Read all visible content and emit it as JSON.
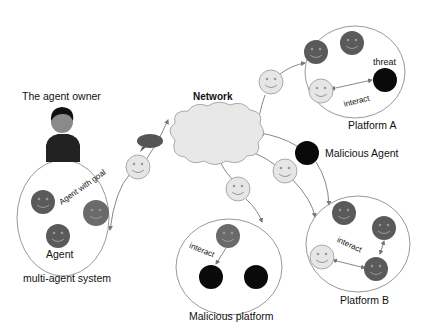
{
  "labels": {
    "agent_owner": "The agent owner",
    "network": "Network",
    "platform_a": "Platform A",
    "malicious_agent": "Malicious Agent",
    "platform_b": "Platform B",
    "malicious_platform": "Malicious platform",
    "multi_agent_system": "multi-agent system",
    "agent": "Agent",
    "agent_with_goal": "Agent with goal",
    "threat": "threat",
    "interact_a": "interact",
    "interact_b": "interact",
    "interact_mp": "interact"
  },
  "colors": {
    "benign_agent": "#e6e6e6",
    "platform_agent": "#5a5a5a",
    "malicious_agent": "#0a0a0a",
    "cloud": "#e8e8e8",
    "outline": "#8c8c8c"
  }
}
